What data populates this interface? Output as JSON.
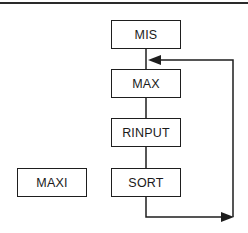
{
  "diagram": {
    "type": "flowchart",
    "nodes": [
      {
        "id": "mis",
        "label": "MIS"
      },
      {
        "id": "max",
        "label": "MAX"
      },
      {
        "id": "rinput",
        "label": "RINPUT"
      },
      {
        "id": "sort",
        "label": "SORT"
      },
      {
        "id": "maxi",
        "label": "MAXI"
      }
    ],
    "edges": [
      {
        "from": "MIS",
        "to": "MAX",
        "style": "line"
      },
      {
        "from": "MAX",
        "to": "RINPUT",
        "style": "line"
      },
      {
        "from": "RINPUT",
        "to": "SORT",
        "style": "line"
      },
      {
        "from": "SORT",
        "to": "MAX",
        "style": "loop-arrow",
        "note": "loop back from below SORT around the right side into the MIS–MAX connector"
      }
    ],
    "colors": {
      "line": "#1e1e1e",
      "background": "#ffffff"
    }
  }
}
